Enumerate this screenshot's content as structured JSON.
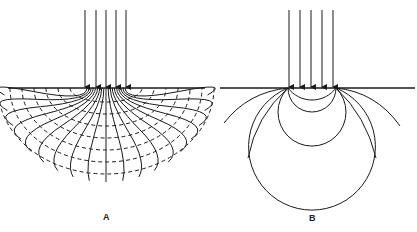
{
  "panels": [
    {
      "id": "A",
      "label": "A",
      "description": "Current flow lines radiating from a distributed surface source with dashed equipotential arcs",
      "surface_y": 88,
      "arrow_xs": [
        85,
        96,
        106,
        116,
        126
      ],
      "arrow_top_y": 10,
      "center_x": 106
    },
    {
      "id": "B",
      "label": "B",
      "description": "Circular flow lines between two surface electrodes",
      "surface_y": 88,
      "arrow_xs": [
        289,
        300,
        311,
        322,
        333
      ],
      "arrow_top_y": 10,
      "electrode_xs": [
        288,
        336
      ]
    }
  ],
  "colors": {
    "line": "#1a1a1a",
    "background": "#ffffff"
  }
}
